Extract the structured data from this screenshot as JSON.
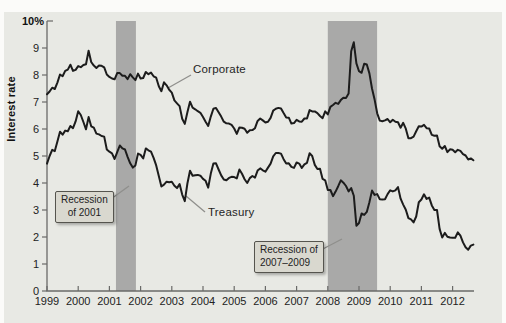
{
  "colors": {
    "page_bg": "#fbfbf9",
    "panel_bg": "#e8e9e4",
    "band": "#a9a9a8",
    "series_line": "#1c1c1c",
    "axis": "#6a6a68",
    "tick_text": "#222222",
    "callout_bg": "#d9d8cf",
    "callout_border": "#55544e",
    "leader_line": "#8f8f8c"
  },
  "chart_data": {
    "type": "line",
    "title": "",
    "xlabel": "",
    "ylabel": "Interest rate",
    "grid": false,
    "legend_position": "inline-annotations",
    "ylim": [
      0,
      10
    ],
    "xlim": [
      1999,
      2012.7
    ],
    "x_start_year": 1999,
    "x_step_years": 0.0833,
    "y_axis": {
      "tick_labels": [
        "0",
        "1",
        "2",
        "3",
        "4",
        "5",
        "6",
        "7",
        "8",
        "9"
      ],
      "top_label": "10%"
    },
    "x_axis": {
      "tick_labels": [
        "1999",
        "2000",
        "2001",
        "2002",
        "2003",
        "2004",
        "2005",
        "2006",
        "2007",
        "2008",
        "2009",
        "2010",
        "2011",
        "2012"
      ]
    },
    "series": [
      {
        "name": "Corporate",
        "values": [
          7.29,
          7.39,
          7.53,
          7.48,
          7.72,
          8.02,
          7.95,
          8.15,
          8.2,
          8.38,
          8.15,
          8.19,
          8.33,
          8.29,
          8.37,
          8.4,
          8.9,
          8.48,
          8.35,
          8.26,
          8.35,
          8.34,
          8.28,
          8.02,
          7.93,
          7.87,
          7.84,
          8.07,
          8.07,
          7.97,
          7.97,
          7.85,
          8.03,
          7.91,
          7.81,
          8.05,
          7.87,
          7.89,
          8.11,
          8.03,
          8.09,
          7.95,
          7.9,
          7.58,
          7.4,
          7.73,
          7.62,
          7.45,
          7.35,
          7.06,
          6.95,
          6.85,
          6.38,
          6.19,
          6.62,
          7.01,
          6.79,
          6.73,
          6.66,
          6.6,
          6.44,
          6.27,
          6.11,
          6.46,
          6.75,
          6.78,
          6.62,
          6.46,
          6.27,
          6.21,
          6.2,
          6.15,
          6.02,
          5.82,
          6.06,
          6.05,
          6.01,
          5.86,
          5.95,
          5.96,
          6.03,
          6.3,
          6.39,
          6.32,
          6.24,
          6.27,
          6.41,
          6.68,
          6.75,
          6.78,
          6.76,
          6.59,
          6.43,
          6.42,
          6.2,
          6.22,
          6.34,
          6.28,
          6.27,
          6.39,
          6.39,
          6.7,
          6.65,
          6.65,
          6.59,
          6.48,
          6.4,
          6.65,
          6.54,
          6.82,
          6.89,
          6.97,
          6.93,
          7.07,
          7.16,
          7.15,
          7.31,
          8.88,
          9.21,
          8.43,
          8.14,
          8.08,
          8.42,
          8.39,
          8.06,
          7.5,
          7.09,
          6.58,
          6.31,
          6.29,
          6.32,
          6.37,
          6.25,
          6.34,
          6.27,
          6.25,
          6.05,
          6.23,
          6.01,
          5.66,
          5.66,
          5.72,
          5.92,
          6.1,
          6.09,
          6.15,
          6.03,
          6.02,
          5.78,
          5.75,
          5.76,
          5.36,
          5.27,
          5.37,
          5.14,
          5.25,
          5.23,
          5.14,
          5.23,
          5.19,
          5.07,
          5.02,
          4.87,
          4.91,
          4.84
        ]
      },
      {
        "name": "Treasury",
        "values": [
          4.72,
          5.0,
          5.23,
          5.18,
          5.54,
          5.9,
          5.79,
          5.94,
          5.92,
          6.11,
          6.03,
          6.28,
          6.66,
          6.52,
          6.26,
          5.99,
          6.44,
          6.1,
          6.05,
          5.83,
          5.8,
          5.74,
          5.72,
          5.24,
          5.16,
          5.1,
          4.89,
          5.14,
          5.39,
          5.28,
          5.24,
          4.97,
          4.73,
          4.57,
          4.65,
          5.09,
          5.04,
          4.91,
          5.28,
          5.21,
          5.16,
          4.93,
          4.65,
          4.26,
          3.87,
          3.94,
          4.05,
          4.03,
          4.05,
          3.9,
          3.81,
          3.96,
          3.57,
          3.33,
          3.98,
          4.45,
          4.27,
          4.29,
          4.3,
          4.27,
          4.15,
          4.08,
          3.83,
          4.35,
          4.72,
          4.73,
          4.5,
          4.28,
          4.13,
          4.1,
          4.19,
          4.23,
          4.22,
          4.17,
          4.5,
          4.34,
          4.14,
          4.0,
          4.18,
          4.26,
          4.2,
          4.46,
          4.54,
          4.47,
          4.42,
          4.57,
          4.72,
          4.99,
          5.11,
          5.11,
          5.09,
          4.88,
          4.72,
          4.73,
          4.6,
          4.56,
          4.76,
          4.72,
          4.56,
          4.69,
          4.75,
          5.1,
          5.0,
          4.67,
          4.52,
          4.53,
          4.15,
          4.1,
          3.74,
          3.74,
          3.51,
          3.68,
          3.88,
          4.1,
          4.01,
          3.89,
          3.69,
          3.81,
          3.53,
          2.42,
          2.52,
          2.87,
          2.82,
          2.93,
          3.29,
          3.72,
          3.56,
          3.59,
          3.4,
          3.39,
          3.4,
          3.59,
          3.73,
          3.69,
          3.73,
          3.85,
          3.42,
          3.2,
          3.01,
          2.7,
          2.65,
          2.54,
          2.76,
          3.29,
          3.39,
          3.58,
          3.41,
          3.46,
          3.17,
          3.0,
          3.0,
          2.3,
          1.98,
          2.15,
          2.01,
          1.98,
          1.97,
          1.97,
          2.17,
          2.05,
          1.8,
          1.62,
          1.53,
          1.68,
          1.72
        ]
      }
    ],
    "recessions": [
      {
        "label_line1": "Recession",
        "label_line2": "of 2001",
        "start": 2001.21,
        "end": 2001.85
      },
      {
        "label_line1": "Recession of",
        "label_line2": "2007–2009",
        "start": 2008.0,
        "end": 2009.58
      }
    ]
  }
}
